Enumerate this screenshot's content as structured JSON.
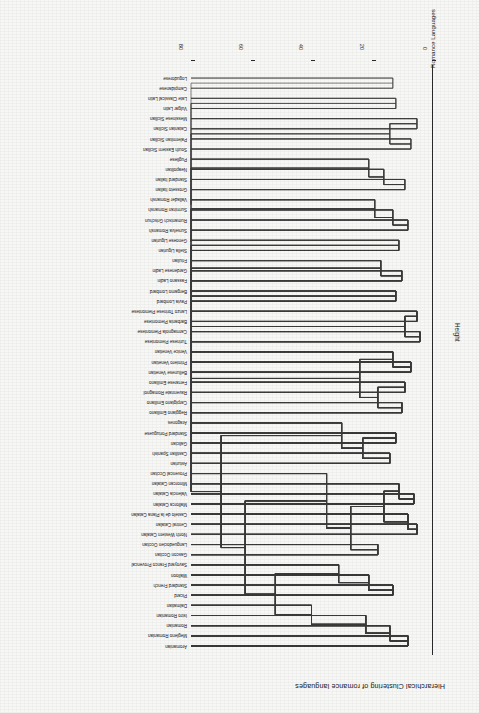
{
  "chart_data": {
    "type": "dendrogram",
    "title": "Hierarchical Clustering of romance languages",
    "xlabel": "Romance Languages",
    "ylabel": "Height",
    "orientation": "rotated-180",
    "grid": false,
    "legend": "none",
    "ylim": [
      0,
      80
    ],
    "yticks": [
      0,
      20,
      40,
      60,
      80
    ],
    "ytick_labels": [
      "0",
      "20",
      "40",
      "60",
      "80"
    ],
    "leaf_count": 64,
    "leaves": [
      "Aromanian",
      "Megleno Romanian",
      "Romanian",
      "Istro Romanian",
      "Dalmatian",
      "Picard",
      "Standard French",
      "Walloon",
      "Savoyard Franco Provencal",
      "Gascon Occitan",
      "Languedocien Occitan",
      "North Western Catalan",
      "Central Catalan",
      "Castelo de la Plana Catalan",
      "Mallorca Catalan",
      "Valencia Catalan",
      "Minorcan Catalan",
      "Provencal Occitan",
      "Asturian",
      "Castilian Spanish",
      "Galician",
      "Standard Portuguese",
      "Aragones",
      "Reggiano Emiliano",
      "Carpigiano Emiliano",
      "Ravennate Romagnol",
      "Ferrarese Emiliano",
      "Bellunese Venetian",
      "Primiero Venetian",
      "Venice Venetian",
      "Turinese Piemontese",
      "Carmagnola Piemontese",
      "Barbania Piemontese",
      "Lanzo Torinese Piemontese",
      "Pavia Lombard",
      "Bergamo Lombard",
      "Fassano Ladin",
      "Gardenese Ladin",
      "Friulian",
      "Stella Ligurian",
      "Genoese Ligurian",
      "Surselva Romansh",
      "Rumantsch Grischun",
      "Surmiran Romansh",
      "Vallader Romansh",
      "Grosseto Italian",
      "Standard Italian",
      "Neapolitan",
      "Pugliese",
      "South Eastern Sicilian",
      "Palermitan Sicilian",
      "Catanian Sicilian",
      "Messinese Sicilian",
      "Vulgar Latin",
      "Late Classical Latin",
      "Campidanese",
      "Logudorese"
    ],
    "merges": [
      {
        "children": [
          0,
          1
        ],
        "height": 8
      },
      {
        "children": [
          "n0",
          2
        ],
        "height": 14
      },
      {
        "children": [
          "n1",
          3
        ],
        "height": 22
      },
      {
        "children": [
          5,
          6
        ],
        "height": 13
      },
      {
        "children": [
          "n3",
          7
        ],
        "height": 21
      },
      {
        "children": [
          "n4",
          8
        ],
        "height": 31
      },
      {
        "children": [
          9,
          10
        ],
        "height": 18
      },
      {
        "children": [
          11,
          12
        ],
        "height": 5
      },
      {
        "children": [
          "n7",
          13
        ],
        "height": 8
      },
      {
        "children": [
          14,
          15
        ],
        "height": 6
      },
      {
        "children": [
          "n9",
          16
        ],
        "height": 11
      },
      {
        "children": [
          "n8",
          "n10"
        ],
        "height": 16
      },
      {
        "children": [
          "n6",
          "n11"
        ],
        "height": 27
      },
      {
        "children": [
          "n12",
          17
        ],
        "height": 35
      },
      {
        "children": [
          18,
          19
        ],
        "height": 14
      },
      {
        "children": [
          20,
          21
        ],
        "height": 12
      },
      {
        "children": [
          "n14",
          "n15"
        ],
        "height": 23
      },
      {
        "children": [
          "n16",
          22
        ],
        "height": 30
      },
      {
        "children": [
          23,
          24
        ],
        "height": 10
      },
      {
        "children": [
          25,
          26
        ],
        "height": 9
      },
      {
        "children": [
          "n18",
          "n19"
        ],
        "height": 18
      },
      {
        "children": [
          27,
          28
        ],
        "height": 7
      },
      {
        "children": [
          "n21",
          29
        ],
        "height": 13
      },
      {
        "children": [
          "n20",
          "n22"
        ],
        "height": 24
      },
      {
        "children": [
          30,
          31
        ],
        "height": 4
      },
      {
        "children": [
          32,
          33
        ],
        "height": 5
      },
      {
        "children": [
          "n24",
          "n25"
        ],
        "height": 9
      },
      {
        "children": [
          34,
          35
        ],
        "height": 12
      },
      {
        "children": [
          36,
          37
        ],
        "height": 10
      },
      {
        "children": [
          "n28",
          38
        ],
        "height": 17
      },
      {
        "children": [
          39,
          40
        ],
        "height": 11
      },
      {
        "children": [
          41,
          42
        ],
        "height": 8
      },
      {
        "children": [
          "n31",
          43
        ],
        "height": 13
      },
      {
        "children": [
          "n32",
          44
        ],
        "height": 19
      },
      {
        "children": [
          45,
          46
        ],
        "height": 9
      },
      {
        "children": [
          "n34",
          47
        ],
        "height": 16
      },
      {
        "children": [
          "n35",
          48
        ],
        "height": 21
      },
      {
        "children": [
          49,
          50
        ],
        "height": 7
      },
      {
        "children": [
          51,
          52
        ],
        "height": 5
      },
      {
        "children": [
          "n37",
          "n38"
        ],
        "height": 14
      },
      {
        "children": [
          53,
          54
        ],
        "height": 12
      },
      {
        "children": [
          55,
          56
        ],
        "height": 13
      },
      {
        "children": [
          "root"
        ],
        "height": 80
      }
    ],
    "root_height": 80
  },
  "figure": {
    "title": "Hierarchical Clustering of romance languages",
    "x_axis_label": "Romance Languages",
    "y_axis_label": "Height",
    "tick_labels": [
      "0",
      "20",
      "40",
      "60",
      "80"
    ]
  },
  "colors": {
    "background": "#f7f7f5",
    "line": "#3a3a3a",
    "text": "#151515",
    "axis": "#2b2b2b"
  }
}
